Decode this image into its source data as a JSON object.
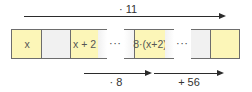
{
  "top_arrow": {
    "label": "· 11"
  },
  "cells": {
    "c1": "x",
    "c2": "",
    "c3": "x + 2",
    "c4": "8·(x+2)",
    "c5": "",
    "c6": ""
  },
  "ellipsis": [
    "···",
    "···"
  ],
  "bottom_arrows": [
    {
      "label": "· 8"
    },
    {
      "label": "+ 56"
    }
  ],
  "colors": {
    "yellow_cell": "#fcf6b8",
    "gray_cell": "#f1f1f1",
    "arrow": "#2b2b2b",
    "border": "#6d6d6d"
  }
}
